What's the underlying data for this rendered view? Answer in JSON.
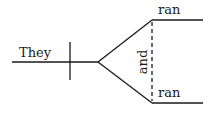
{
  "diagram": {
    "type": "sentence-diagram",
    "subject": "They",
    "predicates": [
      "ran",
      "ran"
    ],
    "conjunction": "and",
    "line_color": "#1a1a1a"
  }
}
